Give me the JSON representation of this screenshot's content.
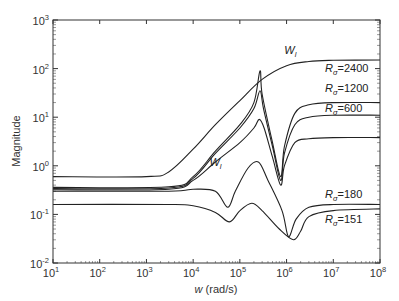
{
  "chart_data": {
    "type": "line",
    "title": "",
    "xlabel_var": "w",
    "xlabel_unit": " (rad/s)",
    "ylabel": "Magnitude",
    "xscale": "log",
    "yscale": "log",
    "xlim": [
      10,
      100000000
    ],
    "ylim": [
      0.01,
      1000
    ],
    "grid": false,
    "x_ticks": [
      {
        "base": "10",
        "exp": "1"
      },
      {
        "base": "10",
        "exp": "2"
      },
      {
        "base": "10",
        "exp": "3"
      },
      {
        "base": "10",
        "exp": "4"
      },
      {
        "base": "10",
        "exp": "5"
      },
      {
        "base": "10",
        "exp": "6"
      },
      {
        "base": "10",
        "exp": "7"
      },
      {
        "base": "10",
        "exp": "8"
      }
    ],
    "y_ticks": [
      {
        "base": "10",
        "exp": "-2"
      },
      {
        "base": "10",
        "exp": "-1"
      },
      {
        "base": "10",
        "exp": "0"
      },
      {
        "base": "10",
        "exp": "1"
      },
      {
        "base": "10",
        "exp": "2"
      },
      {
        "base": "10",
        "exp": "3"
      }
    ],
    "series": [
      {
        "name": "W_l",
        "label_main": "W",
        "label_sub": "l",
        "points": [
          [
            10,
            0.6
          ],
          [
            1000,
            0.6
          ],
          [
            3000,
            0.75
          ],
          [
            10000,
            2.2
          ],
          [
            30000,
            7
          ],
          [
            100000,
            22
          ],
          [
            300000,
            60
          ],
          [
            1000000,
            115
          ],
          [
            3000000,
            140
          ],
          [
            10000000,
            148
          ],
          [
            100000000,
            150
          ]
        ]
      },
      {
        "name": "Rσ=2400",
        "label_main": "R",
        "label_sub": "σ",
        "label_value": "=2400",
        "points": [
          [
            10,
            0.36
          ],
          [
            3000,
            0.37
          ],
          [
            10000,
            0.6
          ],
          [
            30000,
            2
          ],
          [
            100000,
            7
          ],
          [
            200000,
            20
          ],
          [
            270000,
            90
          ],
          [
            300000,
            30
          ],
          [
            500000,
            3
          ],
          [
            750000,
            0.6
          ],
          [
            900000,
            2.5
          ],
          [
            1500000,
            12
          ],
          [
            3000000,
            18
          ],
          [
            10000000,
            20
          ],
          [
            100000000,
            20
          ]
        ]
      },
      {
        "name": "Rσ=1200",
        "label_main": "R",
        "label_sub": "σ",
        "label_value": "=1200",
        "points": [
          [
            10,
            0.34
          ],
          [
            3000,
            0.35
          ],
          [
            10000,
            0.55
          ],
          [
            30000,
            1.8
          ],
          [
            100000,
            6
          ],
          [
            200000,
            15
          ],
          [
            270000,
            35
          ],
          [
            320000,
            15
          ],
          [
            500000,
            2.5
          ],
          [
            750000,
            0.5
          ],
          [
            900000,
            1.8
          ],
          [
            1500000,
            7
          ],
          [
            3000000,
            10
          ],
          [
            10000000,
            11
          ],
          [
            100000000,
            11
          ]
        ]
      },
      {
        "name": "Rσ=600",
        "label_main": "R",
        "label_sub": "σ",
        "label_value": "=600",
        "points": [
          [
            10,
            0.32
          ],
          [
            3000,
            0.33
          ],
          [
            10000,
            0.5
          ],
          [
            30000,
            1.2
          ],
          [
            100000,
            3
          ],
          [
            200000,
            6
          ],
          [
            260000,
            9
          ],
          [
            330000,
            6
          ],
          [
            500000,
            1.5
          ],
          [
            750000,
            0.4
          ],
          [
            900000,
            1
          ],
          [
            1500000,
            3
          ],
          [
            3000000,
            3.6
          ],
          [
            10000000,
            3.8
          ],
          [
            100000000,
            3.8
          ]
        ]
      },
      {
        "name": "Rσ=180",
        "label_main": "R",
        "label_sub": "σ",
        "label_value": "=180",
        "points": [
          [
            10,
            0.3
          ],
          [
            3000,
            0.3
          ],
          [
            10000,
            0.33
          ],
          [
            30000,
            0.3
          ],
          [
            55000,
            0.14
          ],
          [
            80000,
            0.3
          ],
          [
            150000,
            0.9
          ],
          [
            250000,
            1.2
          ],
          [
            400000,
            0.5
          ],
          [
            800000,
            0.12
          ],
          [
            1100000,
            0.035
          ],
          [
            1600000,
            0.08
          ],
          [
            3000000,
            0.14
          ],
          [
            10000000,
            0.16
          ],
          [
            100000000,
            0.16
          ]
        ]
      },
      {
        "name": "Rσ=151",
        "label_main": "R",
        "label_sub": "σ",
        "label_value": "=151",
        "points": [
          [
            10,
            0.16
          ],
          [
            3000,
            0.16
          ],
          [
            10000,
            0.15
          ],
          [
            30000,
            0.11
          ],
          [
            60000,
            0.07
          ],
          [
            100000,
            0.12
          ],
          [
            180000,
            0.17
          ],
          [
            300000,
            0.12
          ],
          [
            700000,
            0.05
          ],
          [
            1400000,
            0.03
          ],
          [
            2000000,
            0.045
          ],
          [
            3000000,
            0.09
          ],
          [
            10000000,
            0.12
          ],
          [
            100000000,
            0.13
          ]
        ]
      }
    ],
    "annotations": [
      {
        "text_main": "W",
        "text_sub": "l",
        "x": 30000,
        "y": 0.9
      },
      {
        "text_main": "W",
        "text_sub": "l",
        "x": 1200000,
        "y": 180
      }
    ]
  }
}
